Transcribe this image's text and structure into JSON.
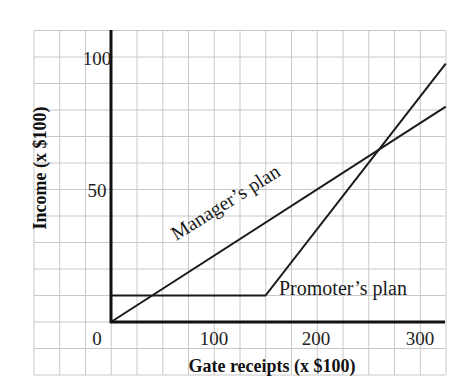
{
  "chart_data": {
    "type": "line",
    "title": "",
    "xlabel": "Gate receipts (x $100)",
    "ylabel": "Income (x $100)",
    "xlim": [
      0,
      325
    ],
    "ylim": [
      0,
      110
    ],
    "x_ticks": [
      0,
      100,
      200,
      300
    ],
    "x_tick_labels": [
      "0",
      "100",
      "200",
      "300"
    ],
    "y_ticks": [
      50,
      100
    ],
    "y_tick_labels": [
      "50",
      "100"
    ],
    "grid": true,
    "legend": "inline labels",
    "series": [
      {
        "name": "Manager's plan",
        "label": "Manager’s plan",
        "points": [
          [
            0,
            0
          ],
          [
            325,
            81.25
          ]
        ]
      },
      {
        "name": "Promoter's plan",
        "label": "Promoter’s plan",
        "points": [
          [
            0,
            10
          ],
          [
            150,
            10
          ],
          [
            325,
            97.5
          ]
        ]
      }
    ],
    "annotations": [
      {
        "text": "Manager’s plan",
        "near_x": 150,
        "near_y": 45,
        "rotation_deg": -32
      },
      {
        "text": "Promoter’s plan",
        "near_x": 240,
        "near_y": 12
      }
    ]
  }
}
